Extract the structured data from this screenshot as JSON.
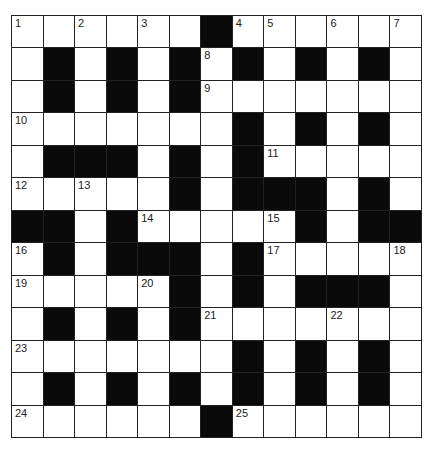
{
  "puzzle": {
    "rows": 13,
    "cols": 13,
    "layout": [
      "WWWWWWBWWWWWW",
      "WBWBWBWBWBWBW",
      "WBWBWBWWWWWWW",
      "WWWWWWWBWBWBW",
      "WBBBWBWBWWWWW",
      "WWWWWBWBBBWBW",
      "BBWBWWWWWBWBB",
      "WBWBBBWBWWWWW",
      "WWWWWBWBWBBBW",
      "WBWBWBWWWWWWW",
      "WWWWWWWBWBWBW",
      "WBWBWBWBWBWBW",
      "WWWWWWBWWWWWW"
    ],
    "numbers": [
      {
        "r": 0,
        "c": 0,
        "n": "1"
      },
      {
        "r": 0,
        "c": 2,
        "n": "2"
      },
      {
        "r": 0,
        "c": 4,
        "n": "3"
      },
      {
        "r": 0,
        "c": 7,
        "n": "4"
      },
      {
        "r": 0,
        "c": 8,
        "n": "5"
      },
      {
        "r": 0,
        "c": 10,
        "n": "6"
      },
      {
        "r": 0,
        "c": 12,
        "n": "7"
      },
      {
        "r": 1,
        "c": 6,
        "n": "8"
      },
      {
        "r": 2,
        "c": 6,
        "n": "9"
      },
      {
        "r": 3,
        "c": 0,
        "n": "10"
      },
      {
        "r": 4,
        "c": 8,
        "n": "11"
      },
      {
        "r": 5,
        "c": 0,
        "n": "12"
      },
      {
        "r": 5,
        "c": 2,
        "n": "13"
      },
      {
        "r": 6,
        "c": 4,
        "n": "14"
      },
      {
        "r": 6,
        "c": 8,
        "n": "15"
      },
      {
        "r": 7,
        "c": 0,
        "n": "16"
      },
      {
        "r": 7,
        "c": 8,
        "n": "17"
      },
      {
        "r": 7,
        "c": 12,
        "n": "18"
      },
      {
        "r": 8,
        "c": 0,
        "n": "19"
      },
      {
        "r": 8,
        "c": 4,
        "n": "20"
      },
      {
        "r": 9,
        "c": 6,
        "n": "21"
      },
      {
        "r": 9,
        "c": 10,
        "n": "22"
      },
      {
        "r": 10,
        "c": 0,
        "n": "23"
      },
      {
        "r": 12,
        "c": 0,
        "n": "24"
      },
      {
        "r": 12,
        "c": 7,
        "n": "25"
      }
    ]
  }
}
